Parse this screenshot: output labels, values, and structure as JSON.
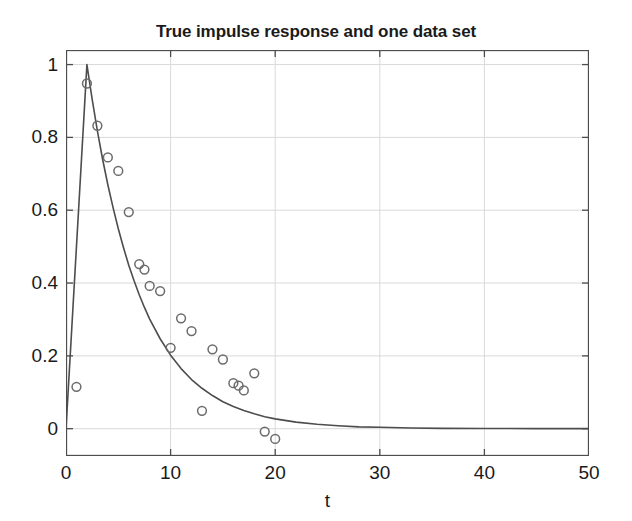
{
  "chart_data": {
    "type": "scatter",
    "title": "True impulse response and one data set",
    "xlabel": "t",
    "ylabel": "",
    "xlim": [
      0,
      50
    ],
    "ylim": [
      -0.075,
      1.04
    ],
    "xticks": [
      0,
      10,
      20,
      30,
      40,
      50
    ],
    "yticks": [
      0,
      0.2,
      0.4,
      0.6,
      0.8,
      1
    ],
    "xtick_labels": [
      "0",
      "10",
      "20",
      "30",
      "40",
      "50"
    ],
    "ytick_labels": [
      "0",
      "0.2",
      "0.4",
      "0.6",
      "0.8",
      "1"
    ],
    "grid": true,
    "legend": null,
    "series": [
      {
        "name": "True impulse response",
        "type": "line",
        "color": "#4d4d4d",
        "x": [
          0,
          0.25,
          0.5,
          0.75,
          1,
          1.25,
          1.5,
          1.75,
          2,
          2.5,
          3,
          3.5,
          4,
          4.5,
          5,
          5.5,
          6,
          6.5,
          7,
          7.5,
          8,
          9,
          10,
          11,
          12,
          13,
          14,
          15,
          16,
          17,
          18,
          19,
          20,
          22,
          24,
          26,
          28,
          30,
          33,
          36,
          40,
          45,
          50
        ],
        "y": [
          0,
          0.125,
          0.25,
          0.375,
          0.5,
          0.625,
          0.75,
          0.875,
          1.0,
          0.905,
          0.818,
          0.74,
          0.67,
          0.607,
          0.549,
          0.497,
          0.449,
          0.407,
          0.368,
          0.333,
          0.301,
          0.247,
          0.202,
          0.165,
          0.135,
          0.111,
          0.091,
          0.074,
          0.061,
          0.05,
          0.041,
          0.033,
          0.027,
          0.018,
          0.012,
          0.008,
          0.005,
          0.004,
          0.002,
          0.001,
          0.0005,
          0.0002,
          0.0001
        ]
      },
      {
        "name": "One data set",
        "type": "scatter",
        "marker": "open-circle",
        "color": "#6b6b6b",
        "x": [
          1,
          2,
          3,
          4,
          5,
          6,
          7,
          7.5,
          8,
          9,
          10,
          11,
          12,
          13,
          14,
          15,
          16,
          16.5,
          17,
          18,
          19,
          20
        ],
        "y": [
          0.115,
          0.948,
          0.832,
          0.745,
          0.708,
          0.595,
          0.452,
          0.437,
          0.392,
          0.378,
          0.222,
          0.303,
          0.268,
          0.049,
          0.218,
          0.19,
          0.125,
          0.118,
          0.105,
          0.152,
          -0.008,
          -0.028
        ]
      }
    ]
  },
  "colors": {
    "axis": "#4d4d4d",
    "grid": "#d9d9d9",
    "curve": "#4d4d4d",
    "marker": "#6b6b6b",
    "text": "#1a1a1a",
    "background": "#ffffff"
  }
}
